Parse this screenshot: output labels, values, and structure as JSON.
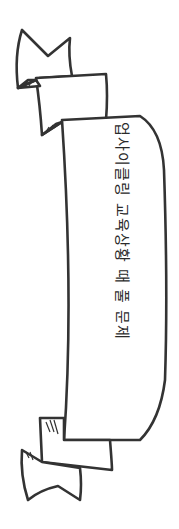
{
  "banner": {
    "text": "업사이클링 교육상황 때 풀 문제",
    "text_orientation": "rotated-90-clockwise",
    "stroke_color": "#333333",
    "fill_color": "#ffffff"
  },
  "decorations": {
    "top_tail": "forked-ribbon-end",
    "bottom_tail": "forked-ribbon-end"
  }
}
